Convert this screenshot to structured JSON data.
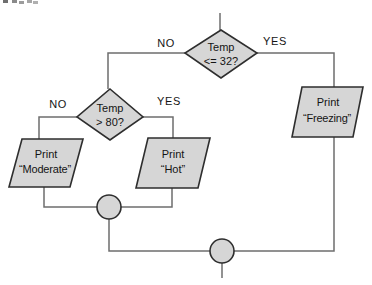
{
  "figure": {
    "type": "flowchart"
  },
  "colors": {
    "background": "#ffffff",
    "shape_fill": "#d6d6d6",
    "shape_border": "#2e2e2e",
    "connector": "#6e6e6e",
    "text": "#141414"
  },
  "flowchart": {
    "decisions": [
      {
        "line1": "Temp",
        "line2": "<= 32?",
        "no_label": "NO",
        "yes_label": "YES"
      },
      {
        "line1": "Temp",
        "line2": "> 80?",
        "no_label": "NO",
        "yes_label": "YES"
      }
    ],
    "processes": [
      {
        "line1": "Print",
        "line2": "“Freezing”"
      },
      {
        "line1": "Print",
        "line2": "“Hot”"
      },
      {
        "line1": "Print",
        "line2": "“Moderate”"
      }
    ]
  }
}
